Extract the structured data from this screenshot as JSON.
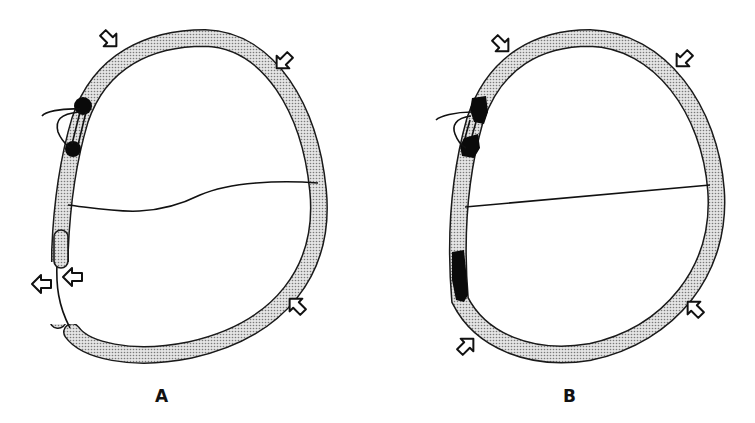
{
  "figure": {
    "panels": [
      {
        "id": "A",
        "label": "A",
        "elements": {
          "chamber_wall": "stippled wall with gap at lower left",
          "valve_annulus": "two black calcified nodules at upper left with valve leaflets",
          "interior_line": "wavy line across chamber",
          "arrows": 6
        }
      },
      {
        "id": "B",
        "label": "B",
        "elements": {
          "chamber_wall": "continuous stippled wall",
          "valve_annulus": "two black nodules at upper left with valve leaflets",
          "scar_region": "black segment along lower left wall",
          "interior_line": "straight line across chamber",
          "arrows": 4
        }
      }
    ]
  },
  "colors": {
    "wall_stroke": "#1a1a1a",
    "wall_fill": "#c8c8c8",
    "nodule": "#0a0a0a",
    "background": "#ffffff"
  }
}
